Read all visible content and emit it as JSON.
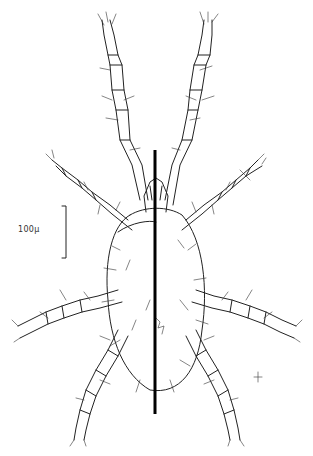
{
  "figure": {
    "scale_bar": {
      "label": "100μ"
    },
    "midline": {
      "color": "#000000"
    },
    "ink_color": "#222222",
    "background": "#ffffff"
  }
}
